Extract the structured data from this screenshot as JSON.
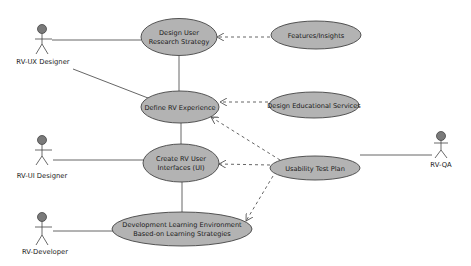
{
  "diagram": {
    "type": "uml-use-case",
    "colors": {
      "usecase_fill": "#b3b3b3",
      "usecase_stroke": "#444444",
      "line": "#555555",
      "actor_head": "#7a7a7a",
      "background": "#ffffff"
    },
    "actors": [
      {
        "id": "ux",
        "label": "RV-UX Designer"
      },
      {
        "id": "ui",
        "label": "RV-UI Designer"
      },
      {
        "id": "dev",
        "label": "RV-Developer"
      },
      {
        "id": "qa",
        "label": "RV-QA"
      }
    ],
    "use_cases": [
      {
        "id": "research",
        "lines": [
          "Design User",
          "Research Strategy"
        ]
      },
      {
        "id": "features",
        "lines": [
          "Features/Insights"
        ]
      },
      {
        "id": "define",
        "lines": [
          "Define RV Experience"
        ]
      },
      {
        "id": "edu",
        "lines": [
          "Design Educational Services"
        ]
      },
      {
        "id": "create",
        "lines": [
          "Create RV User",
          "Interfaces (UI)"
        ]
      },
      {
        "id": "usability",
        "lines": [
          "Usability Test Plan"
        ]
      },
      {
        "id": "devenv",
        "lines": [
          "Development Learning Environment",
          "Based-on Learning Strategies"
        ]
      }
    ],
    "associations": [
      {
        "from": "ux",
        "to": "research"
      },
      {
        "from": "ux",
        "to": "define"
      },
      {
        "from": "ui",
        "to": "create"
      },
      {
        "from": "dev",
        "to": "devenv"
      },
      {
        "from": "qa",
        "to": "usability"
      },
      {
        "from": "research",
        "to": "define"
      },
      {
        "from": "define",
        "to": "create"
      },
      {
        "from": "create",
        "to": "devenv"
      }
    ],
    "dependencies": [
      {
        "from": "features",
        "to": "research",
        "style": "dashed-arrow"
      },
      {
        "from": "edu",
        "to": "define",
        "style": "dashed-arrow"
      },
      {
        "from": "usability",
        "to": "define",
        "style": "dashed-arrow"
      },
      {
        "from": "usability",
        "to": "create",
        "style": "dashed-arrow"
      },
      {
        "from": "usability",
        "to": "devenv",
        "style": "dashed-arrow"
      }
    ]
  }
}
